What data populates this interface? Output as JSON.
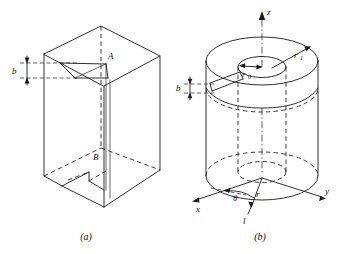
{
  "figure": {
    "panels": [
      {
        "id": "a",
        "caption": "(a)",
        "description": "rectangular block with vertical slit",
        "labels": {
          "point_top": "A",
          "point_bottom": "B",
          "gap_thickness": "b"
        }
      },
      {
        "id": "b",
        "caption": "(b)",
        "description": "hollow cylinder with radial slit and cylindrical coordinates",
        "labels": {
          "axis_z": "z",
          "axis_x": "x",
          "axis_y": "y",
          "inner_radius": "r",
          "inner_radius_sub": "0",
          "outer_radius": "r",
          "outer_radius_sub": "1",
          "gap_thickness": "b",
          "angle": "θ",
          "radius": "r",
          "line": "l"
        }
      }
    ]
  },
  "colors": {
    "ink": "#1a1a1a",
    "background": "#ffffff"
  }
}
